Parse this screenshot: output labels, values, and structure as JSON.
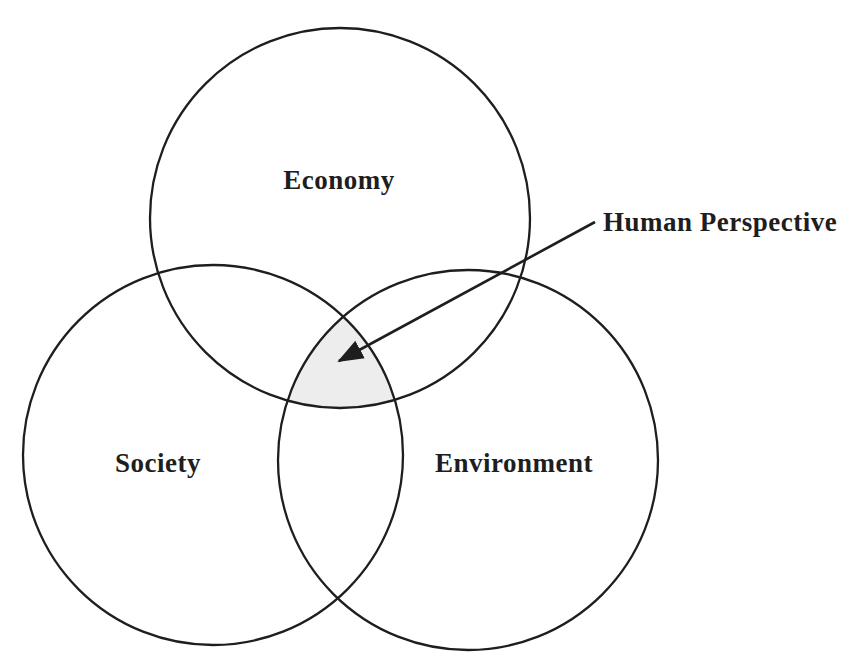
{
  "diagram": {
    "type": "venn-3-circle",
    "colors": {
      "background": "#ffffff",
      "ink": "#1e1e1e",
      "intersection_shade": "#ededed"
    },
    "circles": [
      {
        "id": "economy",
        "label": "Economy",
        "cx": 340,
        "cy": 218,
        "r": 190,
        "label_x": 339,
        "label_y": 189
      },
      {
        "id": "society",
        "label": "Society",
        "cx": 213,
        "cy": 455,
        "r": 190,
        "label_x": 158,
        "label_y": 472
      },
      {
        "id": "environment",
        "label": "Environment",
        "cx": 468,
        "cy": 460,
        "r": 190,
        "label_x": 514,
        "label_y": 472
      }
    ],
    "intersection": {
      "meaning": "triple-overlap of all three circles (shaded)"
    },
    "annotation": {
      "label": "Human Perspective",
      "label_x": 603,
      "label_y": 231,
      "arrow": {
        "x1": 595,
        "y1": 222,
        "x2": 339,
        "y2": 361
      }
    }
  }
}
